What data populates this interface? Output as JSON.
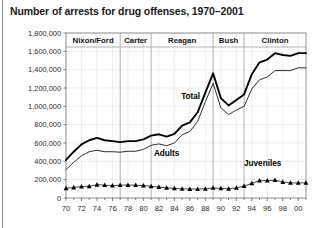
{
  "figure": {
    "title": "Number of arrests for drug offenses, 1970–2001"
  },
  "chart_data": {
    "type": "line",
    "title": "Number of arrests for drug offenses, 1970–2001",
    "xlabel": "",
    "ylabel": "",
    "grid": true,
    "legend_position": "inline-annotations",
    "xlim": [
      1970,
      2001
    ],
    "ylim": [
      0,
      1800000
    ],
    "ytick_values": [
      0,
      200000,
      400000,
      600000,
      800000,
      1000000,
      1200000,
      1400000,
      1600000,
      1800000
    ],
    "ytick_labels": [
      "0",
      "200,000",
      "400,000",
      "600,000",
      "800,000",
      "1,000,000",
      "1,200,000",
      "1,400,000",
      "1,600,000",
      "1,800,000"
    ],
    "xtick_values": [
      1970,
      1972,
      1974,
      1976,
      1978,
      1980,
      1982,
      1984,
      1986,
      1988,
      1990,
      1992,
      1994,
      1996,
      1998,
      2000
    ],
    "xtick_labels": [
      "70",
      "72",
      "74",
      "76",
      "78",
      "80",
      "82",
      "84",
      "86",
      "88",
      "90",
      "92",
      "94",
      "96",
      "98",
      "00"
    ],
    "x": [
      1970,
      1971,
      1972,
      1973,
      1974,
      1975,
      1976,
      1977,
      1978,
      1979,
      1980,
      1981,
      1982,
      1983,
      1984,
      1985,
      1986,
      1987,
      1988,
      1989,
      1990,
      1991,
      1992,
      1993,
      1994,
      1995,
      1996,
      1997,
      1998,
      1999,
      2000,
      2001
    ],
    "series": [
      {
        "name": "Total",
        "label": "Total",
        "color": "#000000",
        "marker": "none",
        "values": [
          415000,
          505000,
          585000,
          630000,
          655000,
          630000,
          620000,
          610000,
          620000,
          620000,
          640000,
          680000,
          695000,
          670000,
          700000,
          790000,
          825000,
          935000,
          1150000,
          1360000,
          1090000,
          1010000,
          1070000,
          1130000,
          1350000,
          1480000,
          1510000,
          1580000,
          1560000,
          1550000,
          1580000,
          1580000
        ]
      },
      {
        "name": "Adults",
        "label": "Adults",
        "color": "#2f2f2f",
        "marker": "none",
        "values": [
          310000,
          390000,
          460000,
          505000,
          520000,
          505000,
          505000,
          500000,
          510000,
          510000,
          530000,
          575000,
          590000,
          570000,
          600000,
          690000,
          725000,
          835000,
          1050000,
          1250000,
          985000,
          910000,
          960000,
          1000000,
          1190000,
          1290000,
          1320000,
          1390000,
          1390000,
          1390000,
          1420000,
          1420000
        ]
      },
      {
        "name": "Juveniles",
        "label": "Juveniles",
        "color": "#1a1a1a",
        "marker": "triangle",
        "values": [
          105000,
          115000,
          125000,
          128000,
          145000,
          140000,
          135000,
          140000,
          142000,
          140000,
          135000,
          128000,
          120000,
          110000,
          105000,
          100000,
          98000,
          98000,
          100000,
          110000,
          105000,
          100000,
          110000,
          130000,
          160000,
          190000,
          190000,
          195000,
          175000,
          165000,
          165000,
          165000
        ]
      }
    ],
    "eras": [
      {
        "label": "Nixon/Ford",
        "start": 1970,
        "end": 1977
      },
      {
        "label": "Carter",
        "start": 1977,
        "end": 1981
      },
      {
        "label": "Reagan",
        "start": 1981,
        "end": 1989
      },
      {
        "label": "Bush",
        "start": 1989,
        "end": 1993
      },
      {
        "label": "Clinton",
        "start": 1993,
        "end": 2001
      }
    ],
    "annotations": [
      {
        "text": "Total",
        "x": 1986.1,
        "y": 1075000
      },
      {
        "text": "Adults",
        "x": 1983.0,
        "y": 455000
      },
      {
        "text": "Juveniles",
        "x": 1995.4,
        "y": 345000
      }
    ]
  }
}
